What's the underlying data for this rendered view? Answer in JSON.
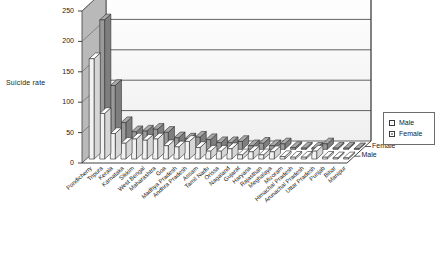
{
  "chart_data": {
    "type": "bar",
    "title": "",
    "subtitle": "",
    "xlabel": "",
    "ylabel": "Suicide rate",
    "ylim": [
      0,
      250
    ],
    "yticks": [
      0,
      50,
      100,
      150,
      200,
      250
    ],
    "grid": true,
    "projection": "3d-clustered-column",
    "legend_position": "right",
    "depth_axis_labels": [
      "Female",
      "Male"
    ],
    "categories": [
      "Pondicherry",
      "Tripura",
      "Kerala",
      "Karnataka",
      "Sikkim",
      "West Bengal",
      "Maharashtra",
      "Goa",
      "Madhya Pradesh",
      "Andhra Pradesh",
      "Assam",
      "Tamil Nadu",
      "Orissa",
      "Nagaland",
      "Gujarat",
      "Haryana",
      "Rajasthan",
      "Meghalaya",
      "Mizoram",
      "Himachal Pradesh",
      "Arunachal Pradesh",
      "Uttar Pradesh",
      "Punjab",
      "Bihar",
      "Manipur"
    ],
    "series": [
      {
        "name": "Male",
        "color": "#f2f2f2",
        "values": [
          165,
          75,
          42,
          26,
          33,
          31,
          33,
          22,
          20,
          29,
          19,
          13,
          13,
          17,
          7,
          12,
          7,
          12,
          4,
          3,
          3,
          13,
          3,
          2,
          2
        ]
      },
      {
        "name": "Female",
        "color": "#9a9a9a",
        "values": [
          213,
          105,
          44,
          29,
          30,
          33,
          28,
          19,
          17,
          20,
          16,
          11,
          11,
          13,
          6,
          10,
          6,
          9,
          3,
          2,
          2,
          9,
          2,
          2,
          1
        ]
      }
    ]
  },
  "legend": {
    "items": [
      {
        "label": "Male",
        "swatch": "#f2f2f2"
      },
      {
        "label": "Female",
        "swatch": "#9a9a9a"
      }
    ]
  },
  "axes": {
    "y_title": "Suicide rate",
    "y_ticks": [
      "250",
      "200",
      "150",
      "100",
      "50",
      "0"
    ]
  }
}
